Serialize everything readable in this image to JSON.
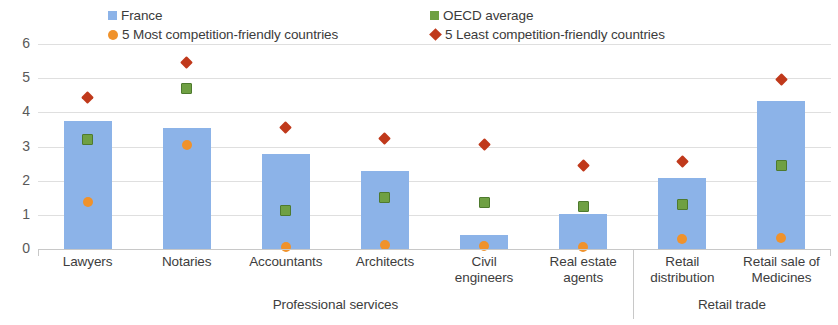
{
  "chart_data": {
    "type": "bar",
    "title": "",
    "subtitle": "",
    "xlabel": "",
    "ylabel": "",
    "ylim": [
      0,
      6
    ],
    "yticks": [
      0,
      1,
      2,
      3,
      4,
      5,
      6
    ],
    "grid": true,
    "legend_position": "top",
    "categories": [
      "Lawyers",
      "Notaries",
      "Accountants",
      "Architects",
      "Civil engineers",
      "Real estate agents",
      "Retail distribution",
      "Retail sale of Medicines"
    ],
    "category_lines": [
      [
        "Lawyers"
      ],
      [
        "Notaries"
      ],
      [
        "Accountants"
      ],
      [
        "Architects"
      ],
      [
        "Civil",
        "engineers"
      ],
      [
        "Real estate",
        "agents"
      ],
      [
        "Retail",
        "distribution"
      ],
      [
        "Retail sale of",
        "Medicines"
      ]
    ],
    "groups": [
      {
        "label": "Professional services",
        "start": 0,
        "end": 5
      },
      {
        "label": "Retail trade",
        "start": 6,
        "end": 7
      }
    ],
    "series": [
      {
        "name": "France",
        "type": "bar",
        "color": "#8CB3E8",
        "values": [
          3.75,
          3.55,
          2.78,
          2.28,
          0.4,
          1.02,
          2.08,
          4.33
        ]
      },
      {
        "name": "OECD average",
        "type": "marker",
        "marker": "square",
        "color": "#6FA043",
        "values": [
          3.2,
          4.7,
          1.13,
          1.52,
          1.35,
          1.25,
          1.3,
          2.43
        ]
      },
      {
        "name": "5 Most competition-friendly countries",
        "type": "marker",
        "marker": "circle",
        "color": "#F0922B",
        "values": [
          1.38,
          3.05,
          0.07,
          0.12,
          0.08,
          0.05,
          0.3,
          0.32
        ]
      },
      {
        "name": "5 Least competition-friendly countries",
        "type": "marker",
        "marker": "diamond",
        "color": "#C0391B",
        "values": [
          4.42,
          5.45,
          3.57,
          3.23,
          3.07,
          2.45,
          2.57,
          4.95
        ]
      }
    ]
  },
  "legend": {
    "items": [
      {
        "label": "France",
        "marker": "square-small",
        "color": "#8CB3E8"
      },
      {
        "label": "OECD average",
        "marker": "square-small",
        "color": "#6FA043"
      },
      {
        "label": "5 Most competition-friendly countries",
        "marker": "circle",
        "color": "#F0922B"
      },
      {
        "label": "5 Least competition-friendly countries",
        "marker": "diamond",
        "color": "#C0391B"
      }
    ]
  },
  "axis": {
    "y_tick_labels": [
      "6",
      "5",
      "4",
      "3",
      "2",
      "1",
      "0"
    ]
  }
}
